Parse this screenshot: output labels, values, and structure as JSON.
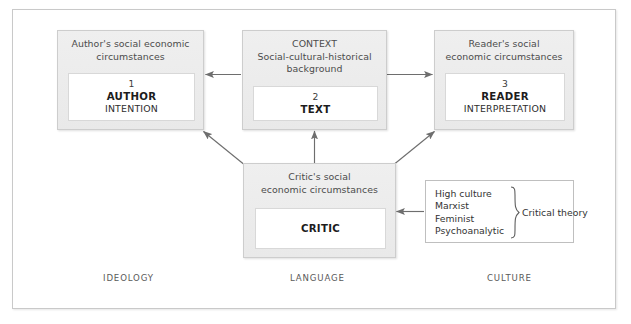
{
  "figure": {
    "nodes": {
      "author": {
        "caption": "Author's social economic\ncircumstances",
        "number": "1",
        "title": "AUTHOR",
        "subtitle": "INTENTION"
      },
      "context": {
        "caption": "CONTEXT\nSocial-cultural-historical\nbackground",
        "number": "2",
        "title": "TEXT",
        "subtitle": ""
      },
      "reader": {
        "caption": "Reader's social\neconomic circumstances",
        "number": "3",
        "title": "READER",
        "subtitle": "INTERPRETATION"
      },
      "critic": {
        "caption": "Critic's social\neconomic circumstances",
        "number": "",
        "title": "CRITIC",
        "subtitle": ""
      }
    },
    "critical_theory": {
      "items": [
        "High culture",
        "Marxist",
        "Feminist",
        "Psychoanalytic"
      ],
      "group_label": "Critical theory"
    },
    "axis_labels": {
      "left": "IDEOLOGY",
      "center": "LANGUAGE",
      "right": "CULTURE"
    },
    "colors": {
      "panel_fill": "#ececec",
      "panel_border": "#cdcdcd",
      "card_fill": "#ffffff",
      "arrow": "#6e6e6e",
      "frame_border": "#c9c9c9",
      "text": "#333333"
    },
    "connectors": [
      {
        "name": "context-to-author",
        "from": "context",
        "to": "author",
        "direction": "left"
      },
      {
        "name": "context-to-reader",
        "from": "context",
        "to": "reader",
        "direction": "right"
      },
      {
        "name": "critic-to-author",
        "from": "critic",
        "to": "author",
        "direction": "up-left"
      },
      {
        "name": "critic-to-context",
        "from": "critic",
        "to": "context",
        "direction": "up"
      },
      {
        "name": "critic-to-reader",
        "from": "critic",
        "to": "reader",
        "direction": "up-right"
      },
      {
        "name": "critical-theory-to-critic",
        "from": "critical_theory",
        "to": "critic",
        "direction": "left"
      }
    ]
  }
}
